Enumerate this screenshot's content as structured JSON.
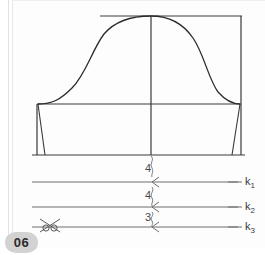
{
  "page": {
    "badge": "06",
    "background_color": "#ffffff",
    "paper_color": "#fdfdfd",
    "ink_color": "#2b2b2b",
    "guide_color": "#6d6d6d"
  },
  "diagram": {
    "type": "sewing-pattern",
    "pieces": {
      "top_line": "horizontal-top-edge",
      "waist_line": "horizontal-waist-edge",
      "hem_line": "horizontal-bottom-edge",
      "center_line": "vertical-center-fold",
      "right_edge": "vertical-right-edge",
      "curve": "bell-shaped-sleeve-cap-curve",
      "left_dart": "left-dart",
      "right_dart": "right-dart"
    }
  },
  "guides": [
    {
      "name": "k1",
      "label": "k",
      "subscript": "1",
      "measure": "4",
      "marker": "chevron-left"
    },
    {
      "name": "k2",
      "label": "k",
      "subscript": "2",
      "measure": "4",
      "marker": "chevron-left"
    },
    {
      "name": "k3",
      "label": "k",
      "subscript": "3",
      "measure": "3",
      "marker": "chevron-left"
    }
  ],
  "measures": {
    "top": "4",
    "middle": "4",
    "bottom": "3"
  },
  "icons": {
    "scissors": "scissors-cut-icon"
  }
}
